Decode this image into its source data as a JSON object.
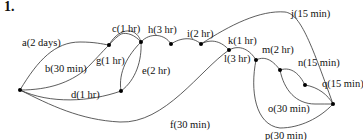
{
  "problem_number": "1.",
  "diagram": {
    "type": "activity-network",
    "edges": [
      {
        "id": "a",
        "label": "a(2 days)"
      },
      {
        "id": "b",
        "label": "b(30 min)"
      },
      {
        "id": "c",
        "label": "c(1 hr)"
      },
      {
        "id": "d",
        "label": "d(1 hr)"
      },
      {
        "id": "e",
        "label": "e(2 hr)"
      },
      {
        "id": "f",
        "label": "f(30 min)"
      },
      {
        "id": "g",
        "label": "g(1 hr)"
      },
      {
        "id": "h",
        "label": "h(3 hr)"
      },
      {
        "id": "i",
        "label": "i(2 hr)"
      },
      {
        "id": "j",
        "label": "j(15 min)"
      },
      {
        "id": "k",
        "label": "k(1 hr)"
      },
      {
        "id": "l",
        "label": "l(3 hr)"
      },
      {
        "id": "m",
        "label": "m(2 hr)"
      },
      {
        "id": "n",
        "label": "n(15 min)"
      },
      {
        "id": "o",
        "label": "o(30 min)"
      },
      {
        "id": "p",
        "label": "p(30 min)"
      },
      {
        "id": "q",
        "label": "q(15 min)"
      }
    ]
  }
}
